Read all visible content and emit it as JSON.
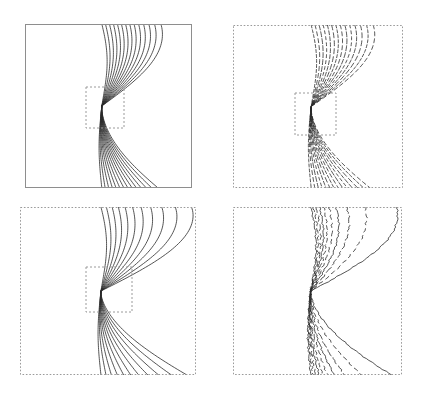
{
  "figure": {
    "title": "",
    "background_color": "#ffffff",
    "width": 421,
    "height": 400,
    "panel_count": 4,
    "line_color": "#2b2b2b",
    "frame_color_solid": "#8a8a8a",
    "frame_color_dotted": "#9a9a9a",
    "inset_box_color": "#9a9a9a"
  },
  "panels": [
    {
      "id": "panel-top-left",
      "label": "",
      "frame_style": "solid",
      "frame_color": "#8e8e8e",
      "line_style": "solid",
      "line_color": "#2a2a2a",
      "line_width": 0.8,
      "contour_count": 14,
      "has_inset_box": true,
      "inset_box": {
        "x": 86,
        "y": 87,
        "width": 38,
        "height": 41
      },
      "bounds": {
        "x": 25,
        "y": 24,
        "width": 167,
        "height": 164
      }
    },
    {
      "id": "panel-top-right",
      "label": "",
      "frame_style": "dotted",
      "frame_color": "#9a9a9a",
      "line_style": "dashed",
      "line_color": "#2a2a2a",
      "line_width": 0.8,
      "contour_count": 14,
      "has_inset_box": true,
      "inset_box": {
        "x": 295,
        "y": 93,
        "width": 41,
        "height": 42
      },
      "bounds": {
        "x": 233,
        "y": 25,
        "width": 170,
        "height": 163
      }
    },
    {
      "id": "panel-bottom-left",
      "label": "",
      "frame_style": "dotted",
      "frame_color": "#9a9a9a",
      "line_style": "solid",
      "line_color": "#2a2a2a",
      "line_width": 0.8,
      "contour_count": 11,
      "has_inset_box": true,
      "inset_box": {
        "x": 86,
        "y": 267,
        "width": 46,
        "height": 45
      },
      "bounds": {
        "x": 20,
        "y": 207,
        "width": 176,
        "height": 168
      }
    },
    {
      "id": "panel-bottom-right",
      "label": "",
      "frame_style": "dotted",
      "frame_color": "#9a9a9a",
      "line_style": "mixed",
      "line_color": "#2a2a2a",
      "line_width": 0.8,
      "contour_count": 10,
      "has_inset_box": false,
      "inset_box": null,
      "bounds": {
        "x": 233,
        "y": 207,
        "width": 169,
        "height": 168
      }
    }
  ],
  "chart_data": {
    "type": "line",
    "title": "",
    "subtitle": "",
    "xlabel": "",
    "ylabel": "",
    "xlim": [
      0,
      1
    ],
    "ylim": [
      0,
      1
    ],
    "grid": false,
    "legend": "none",
    "tick_labels_x": [],
    "tick_labels_y": [],
    "annotations": [],
    "focus_point_normalized": {
      "x": 0.46,
      "y": 0.5
    },
    "panel_series": [
      {
        "panel": "panel-top-left",
        "style": "solid",
        "count": 14,
        "offsets": [
          0.0,
          0.018,
          0.036,
          0.054,
          0.072,
          0.09,
          0.108,
          0.126,
          0.146,
          0.168,
          0.192,
          0.218,
          0.248,
          0.282
        ],
        "upper_spread": [
          0.0,
          0.02,
          0.042,
          0.064,
          0.086,
          0.108,
          0.131,
          0.154,
          0.178,
          0.203,
          0.23,
          0.259,
          0.29,
          0.325
        ],
        "lower_spread": [
          0.0,
          0.019,
          0.039,
          0.06,
          0.081,
          0.103,
          0.126,
          0.149,
          0.173,
          0.198,
          0.225,
          0.254,
          0.285,
          0.32
        ]
      },
      {
        "panel": "panel-top-right",
        "style": "dashed",
        "count": 14,
        "offsets": [
          0.0,
          0.017,
          0.035,
          0.053,
          0.071,
          0.089,
          0.108,
          0.127,
          0.147,
          0.169,
          0.193,
          0.219,
          0.249,
          0.283
        ],
        "upper_spread": [
          0.0,
          0.021,
          0.043,
          0.065,
          0.088,
          0.111,
          0.134,
          0.158,
          0.183,
          0.209,
          0.237,
          0.267,
          0.3,
          0.336
        ],
        "lower_spread": [
          0.0,
          0.02,
          0.04,
          0.061,
          0.083,
          0.105,
          0.128,
          0.152,
          0.177,
          0.203,
          0.231,
          0.261,
          0.294,
          0.33
        ]
      },
      {
        "panel": "panel-bottom-left",
        "style": "solid",
        "count": 11,
        "offsets": [
          0.0,
          0.026,
          0.054,
          0.084,
          0.116,
          0.152,
          0.192,
          0.238,
          0.292,
          0.358,
          0.44
        ],
        "upper_spread": [
          0.0,
          0.028,
          0.058,
          0.09,
          0.125,
          0.164,
          0.208,
          0.258,
          0.316,
          0.386,
          0.47
        ],
        "lower_spread": [
          0.0,
          0.027,
          0.056,
          0.088,
          0.122,
          0.16,
          0.203,
          0.252,
          0.31,
          0.379,
          0.462
        ]
      },
      {
        "panel": "panel-bottom-right",
        "style": "mixed",
        "count": 10,
        "offsets": [
          0.0,
          0.012,
          0.026,
          0.042,
          0.062,
          0.088,
          0.124,
          0.178,
          0.268,
          0.43
        ],
        "upper_spread": [
          0.0,
          0.014,
          0.03,
          0.048,
          0.07,
          0.099,
          0.138,
          0.196,
          0.292,
          0.462
        ],
        "lower_spread": [
          0.0,
          0.013,
          0.028,
          0.046,
          0.067,
          0.095,
          0.133,
          0.19,
          0.284,
          0.452
        ]
      }
    ]
  }
}
